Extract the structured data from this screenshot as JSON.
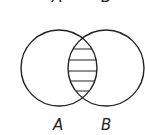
{
  "diagram": {
    "type": "venn",
    "sets": [
      {
        "label": "A",
        "cx": 59,
        "cy": 68,
        "r": 38
      },
      {
        "label": "B",
        "cx": 106,
        "cy": 68,
        "r": 38
      }
    ],
    "shaded_region": "intersection",
    "shading_style": "horizontal-hatch",
    "top_labels": {
      "a": "A",
      "b": "B"
    },
    "bottom_labels": {
      "a": "A",
      "b": "B"
    },
    "stroke_color": "#222222",
    "background": "#ffffff"
  }
}
